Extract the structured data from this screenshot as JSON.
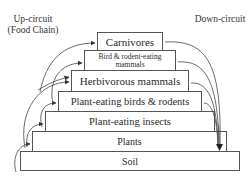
{
  "diagram": {
    "labels": {
      "up_circuit": "Up-circuit",
      "up_circuit_sub": "(Food Chain)",
      "down_circuit": "Down-circuit"
    },
    "levels": [
      {
        "id": "carnivores",
        "label": "Carnivores"
      },
      {
        "id": "bird-rodent-eating-mammals",
        "label": "Bird & rodent-eating mammals",
        "line1": "Bird & rodent-eating",
        "line2": "mammals"
      },
      {
        "id": "herbivorous-mammals",
        "label": "Herbivorous mammals"
      },
      {
        "id": "plant-eating-birds-rodents",
        "label": "Plant-eating birds & rodents"
      },
      {
        "id": "plant-eating-insects",
        "label": "Plant-eating insects"
      },
      {
        "id": "plants",
        "label": "Plants"
      },
      {
        "id": "soil",
        "label": "Soil"
      }
    ],
    "colors": {
      "border": "#555555",
      "text": "#2a2a2a",
      "arrow": "#333333",
      "background": "#ffffff"
    }
  }
}
